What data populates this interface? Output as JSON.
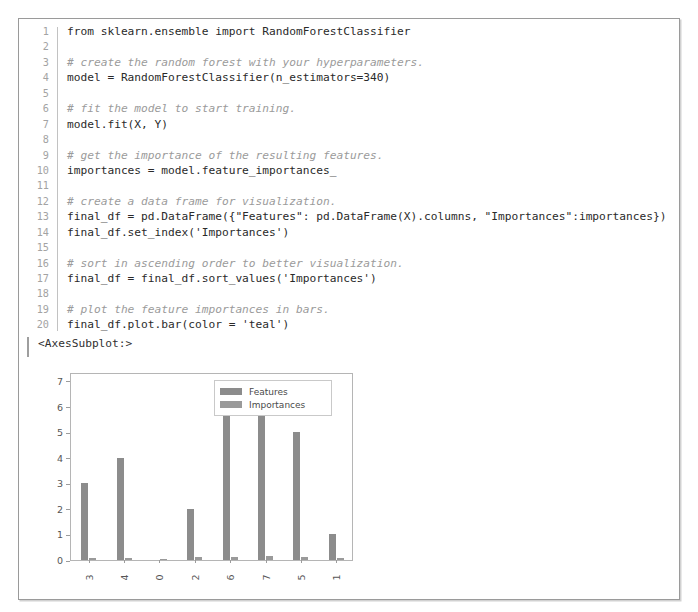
{
  "cell": {
    "code_lines": [
      {
        "n": "1",
        "text": "from sklearn.ensemble import RandomForestClassifier",
        "comment": false
      },
      {
        "n": "2",
        "text": "",
        "comment": false
      },
      {
        "n": "3",
        "text": "# create the random forest with your hyperparameters.",
        "comment": true
      },
      {
        "n": "4",
        "text": "model = RandomForestClassifier(n_estimators=340)",
        "comment": false
      },
      {
        "n": "5",
        "text": "",
        "comment": false
      },
      {
        "n": "6",
        "text": "# fit the model to start training.",
        "comment": true
      },
      {
        "n": "7",
        "text": "model.fit(X, Y)",
        "comment": false
      },
      {
        "n": "8",
        "text": "",
        "comment": false
      },
      {
        "n": "9",
        "text": "# get the importance of the resulting features.",
        "comment": true
      },
      {
        "n": "10",
        "text": "importances = model.feature_importances_",
        "comment": false
      },
      {
        "n": "11",
        "text": "",
        "comment": false
      },
      {
        "n": "12",
        "text": "# create a data frame for visualization.",
        "comment": true
      },
      {
        "n": "13",
        "text": "final_df = pd.DataFrame({\"Features\": pd.DataFrame(X).columns, \"Importances\":importances})",
        "comment": false
      },
      {
        "n": "14",
        "text": "final_df.set_index('Importances')",
        "comment": false
      },
      {
        "n": "15",
        "text": "",
        "comment": false
      },
      {
        "n": "16",
        "text": "# sort in ascending order to better visualization.",
        "comment": true
      },
      {
        "n": "17",
        "text": "final_df = final_df.sort_values('Importances')",
        "comment": false
      },
      {
        "n": "18",
        "text": "",
        "comment": false
      },
      {
        "n": "19",
        "text": "# plot the feature importances in bars.",
        "comment": true
      },
      {
        "n": "20",
        "text": "final_df.plot.bar(color = 'teal')",
        "comment": false
      }
    ],
    "output_repr": "<AxesSubplot:>"
  },
  "chart_data": {
    "type": "bar",
    "title": "",
    "xlabel": "",
    "ylabel": "",
    "categories": [
      "3",
      "4",
      "0",
      "2",
      "6",
      "7",
      "5",
      "1"
    ],
    "series": [
      {
        "name": "Features",
        "values": [
          3,
          4,
          0,
          2,
          6,
          7,
          5,
          1
        ],
        "color": "#8c8c8c"
      },
      {
        "name": "Importances",
        "values": [
          0.08,
          0.09,
          0.05,
          0.1,
          0.12,
          0.14,
          0.13,
          0.07
        ],
        "color": "#9a9a9a"
      }
    ],
    "yticks": [
      0,
      1,
      2,
      3,
      4,
      5,
      6,
      7
    ],
    "ylim": [
      0,
      7.35
    ],
    "grid": false,
    "legend_position": "upper-center"
  }
}
